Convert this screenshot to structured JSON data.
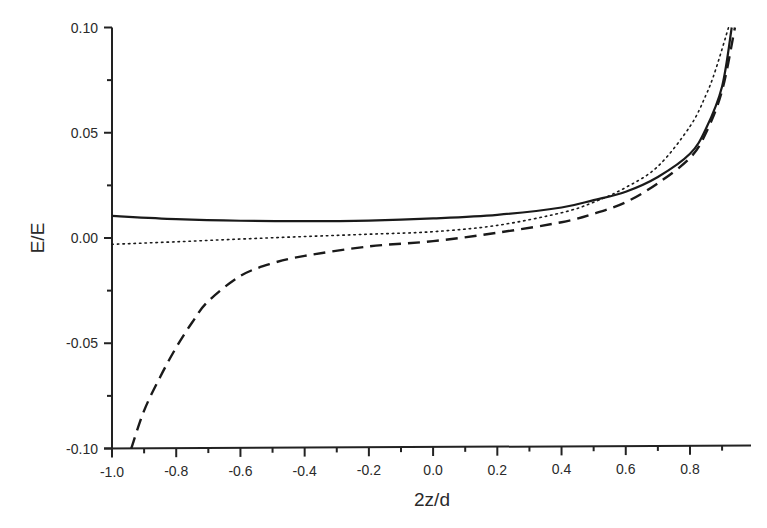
{
  "chart_data": {
    "type": "line",
    "title": "",
    "xlabel": "2z/d",
    "ylabel": "E/E",
    "xlim": [
      -1.0,
      0.98
    ],
    "ylim": [
      -0.1,
      0.1
    ],
    "grid": false,
    "legend": null,
    "x_ticks": [
      "-1.0",
      "-0.8",
      "-0.6",
      "-0.4",
      "-0.2",
      "0.0",
      "0.2",
      "0.4",
      "0.6",
      "0.8"
    ],
    "y_ticks": [
      "0.10",
      "0.05",
      "0.00",
      "-0.05",
      "-0.10"
    ],
    "series": [
      {
        "name": "solid",
        "style": "solid",
        "x": [
          -1.0,
          -0.8,
          -0.6,
          -0.4,
          -0.2,
          0.0,
          0.2,
          0.4,
          0.5,
          0.6,
          0.7,
          0.8,
          0.85,
          0.9,
          0.93
        ],
        "y": [
          0.0105,
          0.009,
          0.0082,
          0.008,
          0.0083,
          0.0093,
          0.011,
          0.0145,
          0.018,
          0.022,
          0.029,
          0.04,
          0.052,
          0.072,
          0.1
        ]
      },
      {
        "name": "dotted",
        "style": "dotted",
        "x": [
          -1.0,
          -0.8,
          -0.6,
          -0.4,
          -0.2,
          0.0,
          0.2,
          0.4,
          0.5,
          0.6,
          0.7,
          0.8,
          0.85,
          0.88,
          0.92
        ],
        "y": [
          -0.003,
          -0.0018,
          -0.0005,
          0.0007,
          0.0018,
          0.003,
          0.006,
          0.012,
          0.017,
          0.024,
          0.034,
          0.053,
          0.068,
          0.08,
          0.1
        ]
      },
      {
        "name": "dashed",
        "style": "dashed",
        "x": [
          -0.94,
          -0.9,
          -0.85,
          -0.8,
          -0.75,
          -0.7,
          -0.6,
          -0.5,
          -0.4,
          -0.2,
          0.0,
          0.2,
          0.4,
          0.5,
          0.6,
          0.7,
          0.8,
          0.85,
          0.9,
          0.94
        ],
        "y": [
          -0.1,
          -0.082,
          -0.066,
          -0.052,
          -0.04,
          -0.03,
          -0.018,
          -0.012,
          -0.0085,
          -0.004,
          -0.0015,
          0.0025,
          0.0075,
          0.0115,
          0.017,
          0.026,
          0.038,
          0.05,
          0.07,
          0.1
        ]
      }
    ]
  }
}
